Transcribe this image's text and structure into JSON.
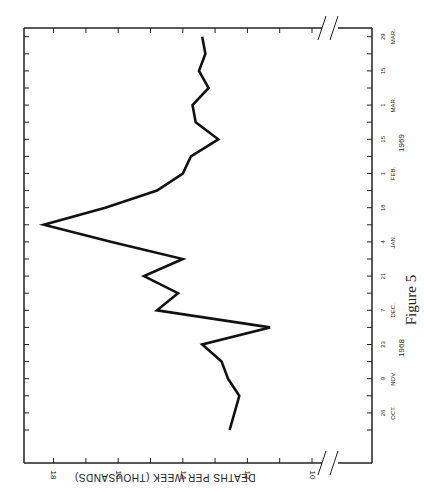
{
  "chart_data": {
    "type": "line",
    "title": "",
    "caption": "Figure 5",
    "xlabel": "",
    "ylabel": "DEATHS PER WEEK (THOUSANDS)",
    "ylim": [
      10,
      18.5
    ],
    "yticks": [
      "10",
      "12",
      "14",
      "16",
      "18"
    ],
    "xtick_labels": [
      {
        "day": "26",
        "month": "OCT."
      },
      {
        "day": "9",
        "month": "NOV."
      },
      {
        "day": "23",
        "month": ""
      },
      {
        "day": "7",
        "month": "DEC."
      },
      {
        "day": "21",
        "month": ""
      },
      {
        "day": "4",
        "month": "JAN."
      },
      {
        "day": "18",
        "month": ""
      },
      {
        "day": "1",
        "month": "FEB."
      },
      {
        "day": "15",
        "month": ""
      },
      {
        "day": "1",
        "month": "MAR."
      },
      {
        "day": "15",
        "month": ""
      },
      {
        "day": "29",
        "month": "MAR."
      }
    ],
    "year_labels": [
      "1968",
      "1969"
    ],
    "x": [
      "1968-10-19",
      "1968-10-26",
      "1968-11-02",
      "1968-11-09",
      "1968-11-16",
      "1968-11-23",
      "1968-11-30",
      "1968-12-07",
      "1968-12-14",
      "1968-12-21",
      "1968-12-28",
      "1969-01-04",
      "1969-01-11",
      "1969-01-18",
      "1969-01-25",
      "1969-02-01",
      "1969-02-08",
      "1969-02-15",
      "1969-02-22",
      "1969-03-01",
      "1969-03-08",
      "1969-03-15",
      "1969-03-22",
      "1969-03-29"
    ],
    "series": [
      {
        "name": "Deaths per week",
        "values": [
          12.55,
          12.4,
          12.25,
          12.6,
          12.8,
          13.4,
          11.3,
          14.8,
          14.15,
          15.2,
          14.0,
          16.2,
          18.3,
          16.4,
          14.8,
          14.0,
          13.75,
          12.9,
          13.6,
          13.7,
          13.2,
          13.5,
          13.3,
          13.4
        ]
      }
    ],
    "orientation": "rotated 90 degrees (time axis vertical, values increase to the left)",
    "axis_break": true
  }
}
